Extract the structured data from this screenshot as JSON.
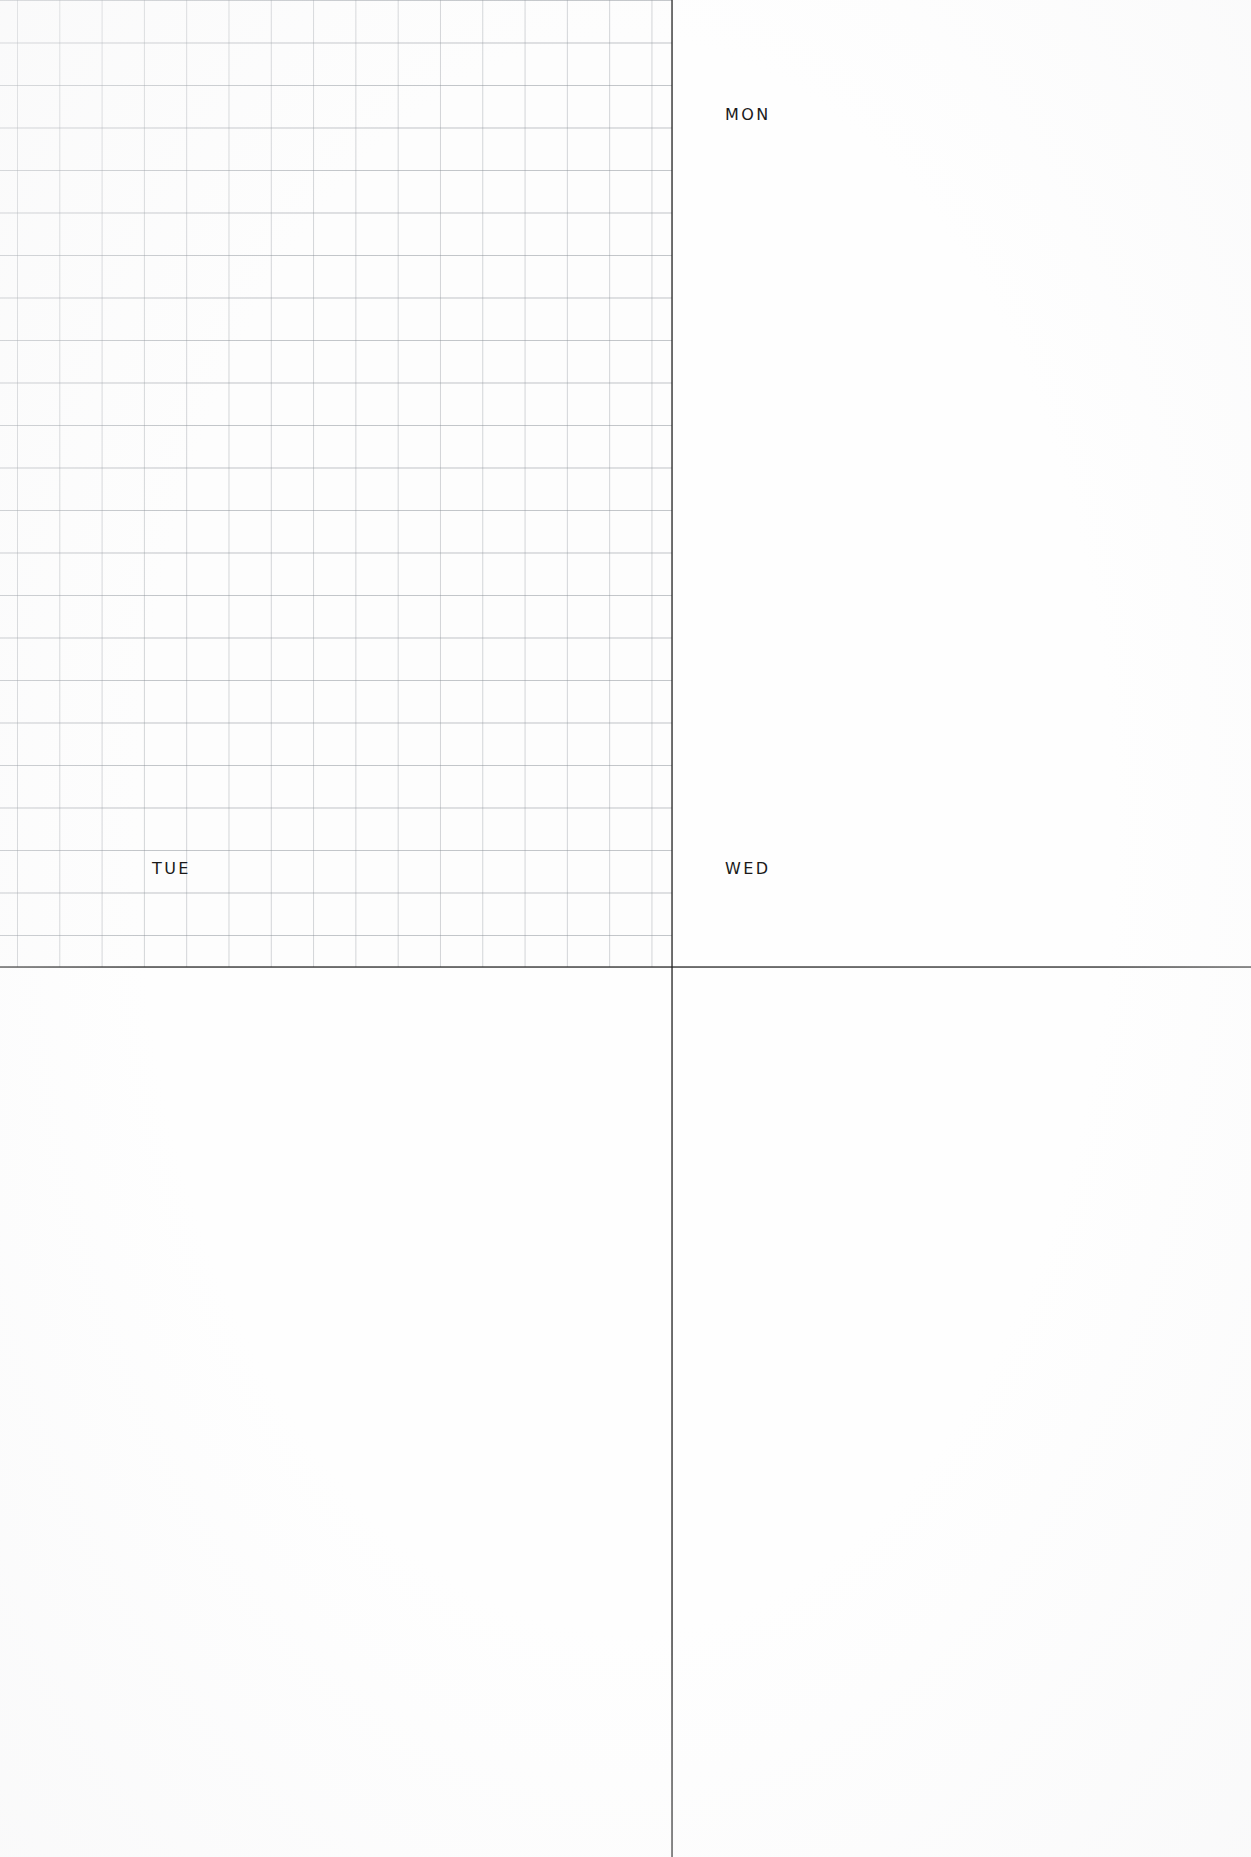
{
  "page": {
    "kind": "weekly-planner-scan",
    "background_color": "#fefefe",
    "width": 1251,
    "height": 1857
  },
  "layout": {
    "divider_color": "#202020",
    "vertical_divider_x": 671,
    "horizontal_divider_y": 966
  },
  "grid": {
    "name": "graph-paper",
    "cell_size_px": 42,
    "line_color": "#969ba2",
    "columns": 16,
    "rows": 23,
    "origin_x": 17,
    "origin_y": 0,
    "width": 672,
    "height": 967
  },
  "quadrants": [
    {
      "id": "grid",
      "label": "",
      "has_grid": true,
      "content": ""
    },
    {
      "id": "mon",
      "label": "MON",
      "has_grid": false,
      "content": ""
    },
    {
      "id": "tue",
      "label": "TUE",
      "has_grid": false,
      "content": ""
    },
    {
      "id": "wed",
      "label": "WED",
      "has_grid": false,
      "content": ""
    }
  ],
  "labels": {
    "mon": "MON",
    "tue": "TUE",
    "wed": "WED"
  }
}
